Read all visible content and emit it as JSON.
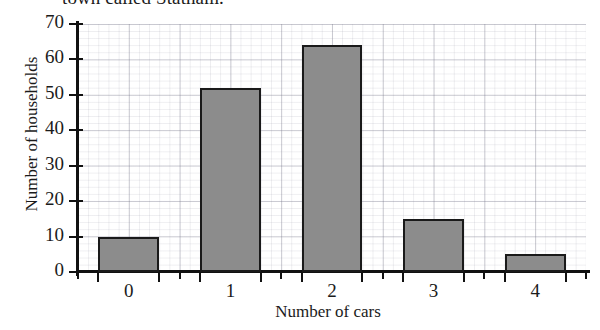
{
  "caption": {
    "text": "town called Statham."
  },
  "chart_data": {
    "type": "bar",
    "title": "",
    "subtitle": "",
    "xlabel": "Number of cars",
    "ylabel": "Number of households",
    "categories": [
      "0",
      "1",
      "2",
      "3",
      "4"
    ],
    "values": [
      10,
      52,
      64,
      15,
      5
    ],
    "series": [
      {
        "name": "Number of households",
        "values": [
          10,
          52,
          64,
          15,
          5
        ]
      }
    ],
    "xlim": [
      -0.5,
      4.5
    ],
    "ylim": [
      0,
      70
    ],
    "y_ticks": [
      0,
      10,
      20,
      30,
      40,
      50,
      60,
      70
    ],
    "y_tick_labels": [
      "0",
      "10",
      "20",
      "30",
      "40",
      "50",
      "60",
      "70"
    ],
    "x_tick_labels": [
      "0",
      "1",
      "2",
      "3",
      "4"
    ],
    "grid": true,
    "grid_minor": true,
    "legend": false,
    "legend_position": "none",
    "bar_fill_color": "#8c8c8c",
    "bar_edge_color": "#1a1a1a",
    "axis_color": "#111111",
    "grid_color": "#6e6e82",
    "background_color": "#ffffff"
  }
}
